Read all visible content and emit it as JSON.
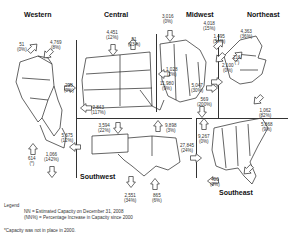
{
  "regions": [
    {
      "name": "Western",
      "flows": [
        {
          "value": "51",
          "pct": "(0%)"
        },
        {
          "value": "4,769",
          "pct": "(8%)"
        },
        {
          "value": "298",
          "pct": "(0%)"
        },
        {
          "value": "614",
          "pct": "(*)"
        },
        {
          "value": "1,066",
          "pct": "(142%)"
        }
      ]
    },
    {
      "name": "Central",
      "flows": [
        {
          "value": "4,451",
          "pct": "(12%)"
        },
        {
          "value": "51",
          "pct": "(23%)"
        },
        {
          "value": "11,980",
          "pct": "(9%)"
        },
        {
          "value": "2,843",
          "pct": "(117%)"
        }
      ]
    },
    {
      "name": "Midwest",
      "flows": [
        {
          "value": "3,016",
          "pct": "(0%)"
        },
        {
          "value": "4,018",
          "pct": "(15%)"
        },
        {
          "value": "1,495",
          "pct": "(54%)"
        },
        {
          "value": "1,028",
          "pct": "(2%)"
        },
        {
          "value": "5,047",
          "pct": "(30%)"
        },
        {
          "value": "569",
          "pct": "(200%)"
        }
      ]
    },
    {
      "name": "Northeast",
      "flows": [
        {
          "value": "4,363",
          "pct": "(36%)"
        },
        {
          "value": "2,100",
          "pct": "(0%)"
        },
        {
          "value": "216",
          "pct": "(*)"
        },
        {
          "value": "1,062",
          "pct": "(82%)"
        }
      ]
    },
    {
      "name": "Southwest",
      "flows": [
        {
          "value": "5,675",
          "pct": "(12%)"
        },
        {
          "value": "3,594",
          "pct": "(22%)"
        },
        {
          "value": "9,898",
          "pct": "(3%)"
        },
        {
          "value": "27,845",
          "pct": "(24%)"
        },
        {
          "value": "2,551",
          "pct": "(34%)"
        },
        {
          "value": "865",
          "pct": "(6%)"
        }
      ]
    },
    {
      "name": "Southeast",
      "flows": [
        {
          "value": "9,267",
          "pct": "(0%)"
        },
        {
          "value": "5,868",
          "pct": "(9%)"
        },
        {
          "value": "400",
          "pct": "(0%)"
        }
      ]
    }
  ],
  "legend": {
    "title": "Legend",
    "line1": "NN = Estimated Capacity on December 31, 2008",
    "line2": "(NN%) = Percentage Increase in Capacity since 2000",
    "footnote": "*Capacity was not in place in 2000."
  }
}
